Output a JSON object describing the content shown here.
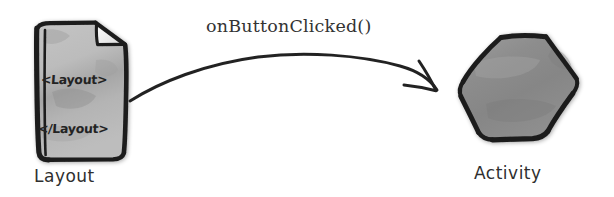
{
  "canvas": {
    "width": 614,
    "height": 197,
    "background_color": "#ffffff"
  },
  "diagram": {
    "type": "flow-relationship",
    "title_text": null,
    "colors": {
      "background": "#ffffff",
      "stroke": "#1c1c1c",
      "layout_fill": "#b8b8b8",
      "layout_fill_dark": "#9a9a9a",
      "activity_fill": "#8a8a8a",
      "activity_fill_light": "#a2a2a2",
      "text": "#2f2f2f",
      "code_text": "#232323"
    },
    "nodes": [
      {
        "id": "layout",
        "shape": "document-page-folded-corner",
        "caption": "Layout",
        "fill": "#b8b8b8",
        "contents": [
          "<Layout>",
          "</Layout>"
        ]
      },
      {
        "id": "activity",
        "shape": "hexagon",
        "caption": "Activity",
        "fill": "#8a8a8a",
        "contents": []
      }
    ],
    "edges": [
      {
        "id": "layout-to-activity",
        "from": "layout",
        "to": "activity",
        "label": "onButtonClicked()",
        "style": "hand-drawn-curved-arrow",
        "direction": "right",
        "arrowhead": "open-v"
      }
    ]
  },
  "labels": {
    "layout_caption": "Layout",
    "activity_caption": "Activity",
    "method_call": "onButtonClicked()",
    "layout_open_tag": "<Layout>",
    "layout_close_tag": "</Layout>"
  }
}
